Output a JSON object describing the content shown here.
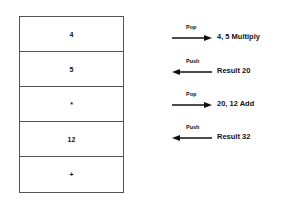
{
  "stack": {
    "cells": [
      "4",
      "5",
      "*",
      "12",
      "+"
    ]
  },
  "operations": [
    {
      "label": "Pop",
      "direction": "right",
      "text": "4,  5   Multiply"
    },
    {
      "label": "Push",
      "direction": "left",
      "text": "Result 20"
    },
    {
      "label": "Pop",
      "direction": "right",
      "text": "20,  12   Add"
    },
    {
      "label": "Push",
      "direction": "left",
      "text": "Result 32"
    }
  ]
}
